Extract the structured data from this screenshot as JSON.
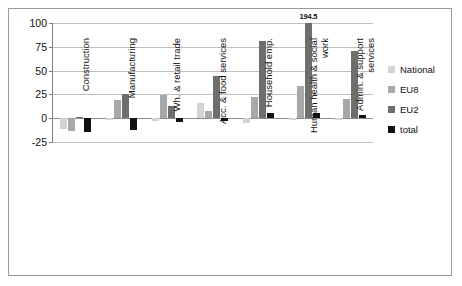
{
  "chart_data": {
    "type": "bar",
    "title": "",
    "subtitle": "",
    "xlabel": "",
    "ylabel": "",
    "ylim": [
      -25,
      100
    ],
    "yticks": [
      -25,
      0,
      25,
      50,
      75,
      100
    ],
    "ytick_labels": [
      "-25",
      "0",
      "25",
      "50",
      "75",
      "100"
    ],
    "grid": true,
    "legend_position": "right",
    "categories": [
      "Construction",
      "Manufacturing",
      "Wh. & retail trade",
      "Acc. & food services",
      "Household emp.",
      "Human health & social work",
      "Admin. & support services"
    ],
    "series": [
      {
        "name": "National",
        "color": "#d3d3d3",
        "values": [
          -11,
          -1.5,
          -3,
          16,
          -5,
          -2,
          -1.5
        ]
      },
      {
        "name": "EU8",
        "color": "#a8a8a8",
        "values": [
          -13,
          19,
          24,
          8,
          22,
          34,
          20
        ]
      },
      {
        "name": "EU2",
        "color": "#6e6e6e",
        "values": [
          1,
          25,
          13,
          44,
          81,
          194.5,
          71
        ]
      },
      {
        "name": "total",
        "color": "#111111",
        "values": [
          -14,
          -12,
          -4,
          -3,
          5,
          5,
          3
        ]
      }
    ],
    "annotations": [
      {
        "text": "194.5",
        "category": "Human health & social work",
        "series": "EU2",
        "value": 194.5
      }
    ]
  },
  "legend": {
    "items": [
      {
        "label": "National",
        "color": "#d3d3d3"
      },
      {
        "label": "EU8",
        "color": "#a8a8a8"
      },
      {
        "label": "EU2",
        "color": "#6e6e6e"
      },
      {
        "label": "total",
        "color": "#111111"
      }
    ]
  }
}
